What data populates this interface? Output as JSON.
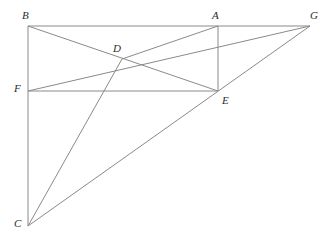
{
  "figure": {
    "background_color": "#ffffff",
    "line_color": "#8a8a8a",
    "label_color": "#2b2b2b",
    "canvas": {
      "width": 330,
      "height": 240
    },
    "points": [
      {
        "id": "A",
        "label": "A",
        "x": 218,
        "y": 26,
        "label_x": 212,
        "label_y": 10
      },
      {
        "id": "B",
        "label": "B",
        "x": 28,
        "y": 26,
        "label_x": 22,
        "label_y": 10
      },
      {
        "id": "C",
        "label": "C",
        "x": 28,
        "y": 226,
        "label_x": 14,
        "label_y": 218
      },
      {
        "id": "D",
        "label": "D",
        "x": 122,
        "y": 59,
        "label_x": 113,
        "label_y": 43
      },
      {
        "id": "E",
        "label": "E",
        "x": 218,
        "y": 91,
        "label_x": 222,
        "label_y": 95
      },
      {
        "id": "F",
        "label": "F",
        "x": 28,
        "y": 91,
        "label_x": 14,
        "label_y": 83
      },
      {
        "id": "G",
        "label": "G",
        "x": 310,
        "y": 26,
        "label_x": 310,
        "label_y": 10
      }
    ],
    "segments": [
      {
        "name": "segment-B-G",
        "from": "B",
        "to": "G"
      },
      {
        "name": "segment-B-C",
        "from": "B",
        "to": "C"
      },
      {
        "name": "segment-F-E",
        "from": "F",
        "to": "E"
      },
      {
        "name": "segment-A-E",
        "from": "A",
        "to": "E"
      },
      {
        "name": "segment-B-E",
        "from": "B",
        "to": "E"
      },
      {
        "name": "segment-F-G",
        "from": "F",
        "to": "G"
      },
      {
        "name": "segment-D-A",
        "from": "D",
        "to": "A"
      },
      {
        "name": "segment-D-C",
        "from": "D",
        "to": "C"
      },
      {
        "name": "segment-C-G",
        "from": "C",
        "to": "G"
      }
    ]
  }
}
